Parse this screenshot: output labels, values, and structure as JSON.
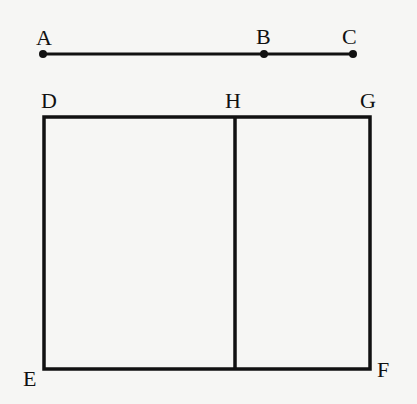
{
  "diagram": {
    "segment": {
      "points": [
        {
          "label": "A",
          "x": 43,
          "y": 54
        },
        {
          "label": "B",
          "x": 264,
          "y": 54
        },
        {
          "label": "C",
          "x": 353,
          "y": 54
        }
      ]
    },
    "rectangle": {
      "corners": [
        {
          "label": "D",
          "x": 44,
          "y": 117
        },
        {
          "label": "G",
          "x": 370,
          "y": 117
        },
        {
          "label": "F",
          "x": 370,
          "y": 369
        },
        {
          "label": "E",
          "x": 44,
          "y": 369
        }
      ],
      "divider": {
        "label": "H",
        "x": 235,
        "y_top": 117,
        "y_bottom": 369
      }
    },
    "labels": {
      "A": "A",
      "B": "B",
      "C": "C",
      "D": "D",
      "H": "H",
      "G": "G",
      "E": "E",
      "F": "F"
    },
    "stroke_color": "#111111"
  }
}
